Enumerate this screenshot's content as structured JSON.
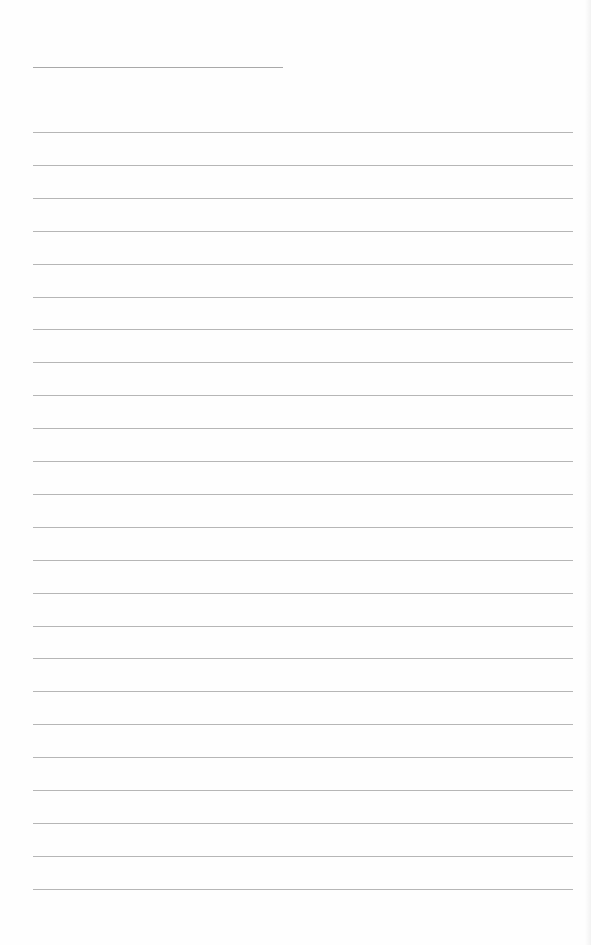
{
  "document": {
    "type": "lined-paper",
    "title_line": {
      "x1": 33,
      "x2": 283,
      "y": 67
    },
    "ruled_lines": {
      "x1": 33,
      "x2": 573,
      "first_y": 132,
      "spacing": 32.9,
      "count": 24
    },
    "colors": {
      "paper": "#fefefe",
      "line": "#a9a9a9"
    }
  }
}
